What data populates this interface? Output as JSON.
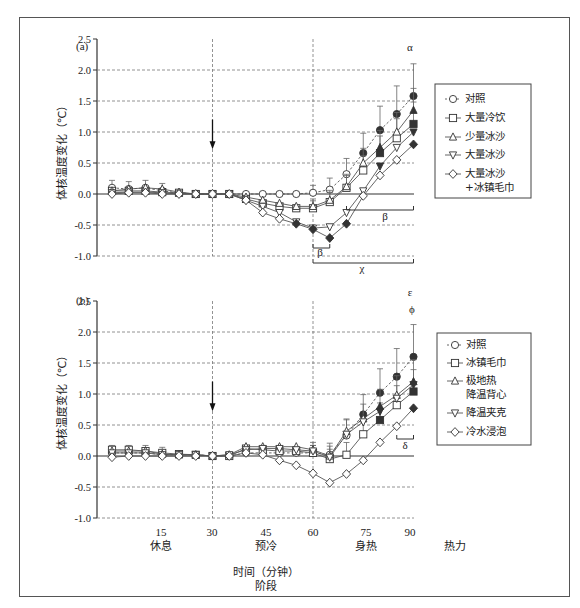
{
  "figure": {
    "xlabel_line1": "时间（分钟）",
    "xlabel_line2": "阶段",
    "x_ticks": [
      "15",
      "30",
      "45",
      "60",
      "75",
      "90"
    ],
    "phases": [
      "休息",
      "预冷",
      "身热",
      "热力"
    ],
    "ylabel": "体核温度变化（℃）",
    "y_ticks": [
      "2.5",
      "2.0",
      "1.5",
      "1.0",
      "0.5",
      "0.0",
      "-0.5",
      "-1.0"
    ]
  },
  "panel_a": {
    "label": "(a)",
    "annotations": {
      "alpha": "α",
      "beta1": "β",
      "beta2": "β",
      "chi": "χ"
    },
    "legend": [
      "对照",
      "大量冷饮",
      "少量冰沙",
      "大量冰沙",
      "大量冰沙",
      "+冰镇毛巾"
    ]
  },
  "panel_b": {
    "label": "(b)",
    "annotations": {
      "epsilon": "ε",
      "phi": "ϕ",
      "delta": "δ"
    },
    "legend": [
      "对照",
      "冰镇毛巾",
      "极地热",
      "降温背心",
      "降温夹克",
      "冷水浸泡"
    ]
  },
  "chart_data": [
    {
      "type": "line",
      "title": "(a)",
      "xlabel": "时间（分钟） / 阶段",
      "ylabel": "体核温度变化（℃）",
      "ylim": [
        -1.0,
        2.5
      ],
      "xlim": [
        0,
        90
      ],
      "grid": true,
      "legend_position": "right",
      "x": [
        0,
        5,
        10,
        15,
        20,
        25,
        30,
        35,
        40,
        45,
        50,
        55,
        60,
        65,
        70,
        75,
        80,
        85,
        90
      ],
      "series": [
        {
          "name": "对照",
          "marker": "circle",
          "values": [
            0.1,
            0.08,
            0.1,
            0.05,
            0.02,
            0.0,
            0.0,
            0.0,
            0.0,
            0.0,
            0.0,
            0.0,
            0.02,
            0.07,
            0.32,
            0.66,
            1.03,
            1.29,
            1.58
          ]
        },
        {
          "name": "大量冷饮",
          "marker": "square",
          "values": [
            0.05,
            0.05,
            0.05,
            0.03,
            0.02,
            0.0,
            0.0,
            0.0,
            -0.08,
            -0.15,
            -0.2,
            -0.23,
            -0.23,
            -0.13,
            0.1,
            0.38,
            0.66,
            0.9,
            1.13
          ]
        },
        {
          "name": "少量冰沙",
          "marker": "triangle-up",
          "values": [
            0.05,
            0.08,
            0.1,
            0.08,
            0.03,
            0.0,
            0.0,
            0.0,
            -0.05,
            -0.1,
            -0.15,
            -0.2,
            -0.2,
            -0.1,
            0.12,
            0.5,
            0.75,
            1.0,
            1.35
          ]
        },
        {
          "name": "大量冰沙",
          "marker": "triangle-down",
          "values": [
            0.02,
            0.03,
            0.03,
            0.02,
            0.0,
            0.0,
            0.0,
            0.0,
            -0.1,
            -0.2,
            -0.3,
            -0.45,
            -0.55,
            -0.53,
            -0.3,
            0.05,
            0.45,
            0.75,
            1.0
          ]
        },
        {
          "name": "大量冰沙+冰镇毛巾",
          "marker": "diamond",
          "values": [
            0.0,
            0.02,
            0.02,
            0.0,
            0.0,
            0.0,
            0.0,
            0.0,
            -0.1,
            -0.3,
            -0.4,
            -0.48,
            -0.57,
            -0.71,
            -0.48,
            -0.03,
            0.3,
            0.55,
            0.8
          ]
        }
      ],
      "annotations": [
        "α at 90 min",
        "β (60–65 min)",
        "β (70–90 min)",
        "χ (60–90 min)"
      ]
    },
    {
      "type": "line",
      "title": "(b)",
      "xlabel": "时间（分钟） / 阶段",
      "ylabel": "体核温度变化（℃）",
      "ylim": [
        -1.0,
        2.5
      ],
      "xlim": [
        0,
        90
      ],
      "grid": true,
      "legend_position": "right",
      "x": [
        0,
        5,
        10,
        15,
        20,
        25,
        30,
        35,
        40,
        45,
        50,
        55,
        60,
        65,
        70,
        75,
        80,
        85,
        90
      ],
      "series": [
        {
          "name": "对照",
          "marker": "circle",
          "values": [
            0.05,
            0.05,
            0.05,
            0.02,
            0.02,
            0.02,
            0.0,
            0.0,
            0.05,
            0.05,
            0.05,
            0.05,
            0.05,
            0.02,
            0.33,
            0.67,
            1.02,
            1.28,
            1.6
          ]
        },
        {
          "name": "冰镇毛巾",
          "marker": "square",
          "values": [
            0.1,
            0.1,
            0.08,
            0.05,
            0.03,
            0.02,
            0.0,
            0.0,
            0.12,
            0.1,
            0.08,
            0.08,
            0.05,
            -0.05,
            0.02,
            0.35,
            0.58,
            0.82,
            1.04
          ]
        },
        {
          "name": "极地热降温背心",
          "marker": "triangle-up",
          "values": [
            0.08,
            0.08,
            0.08,
            0.03,
            0.02,
            0.02,
            0.0,
            0.02,
            0.15,
            0.15,
            0.15,
            0.15,
            0.1,
            0.0,
            0.4,
            0.6,
            0.8,
            0.98,
            1.2
          ]
        },
        {
          "name": "降温夹克",
          "marker": "triangle-down",
          "values": [
            0.05,
            0.05,
            0.05,
            0.02,
            0.02,
            0.02,
            0.0,
            0.02,
            0.1,
            0.12,
            0.12,
            0.1,
            0.08,
            -0.02,
            0.35,
            0.55,
            0.72,
            0.93,
            1.15
          ]
        },
        {
          "name": "冷水浸泡",
          "marker": "diamond",
          "values": [
            -0.02,
            0.0,
            0.0,
            0.0,
            0.0,
            0.0,
            0.0,
            0.0,
            0.05,
            0.02,
            -0.07,
            -0.15,
            -0.28,
            -0.43,
            -0.29,
            -0.07,
            0.22,
            0.48,
            0.77
          ]
        }
      ],
      "annotations": [
        "ε at 90 min",
        "ϕ at 90 min",
        "δ (85–90 min)"
      ]
    }
  ]
}
